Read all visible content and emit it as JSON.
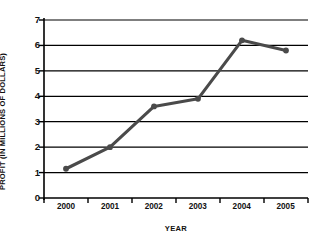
{
  "chart_data": {
    "type": "line",
    "title": "",
    "xlabel": "YEAR",
    "ylabel": "PROFIT (IN MILLIONS OF DOLLARS)",
    "categories": [
      "2000",
      "2001",
      "2002",
      "2003",
      "2004",
      "2005"
    ],
    "x": [
      2000,
      2001,
      2002,
      2003,
      2004,
      2005
    ],
    "values": [
      1.15,
      2.0,
      3.6,
      3.9,
      6.2,
      5.8
    ],
    "series": [
      {
        "name": "Profit",
        "values": [
          1.15,
          2.0,
          3.6,
          3.9,
          6.2,
          5.8
        ]
      }
    ],
    "ylim": [
      0,
      7
    ],
    "yticks": [
      0,
      1,
      2,
      3,
      4,
      5,
      6,
      7
    ],
    "ytick_labels": [
      "0",
      "1",
      "2",
      "3",
      "4",
      "5",
      "6",
      "7"
    ],
    "xtick_labels": [
      "2000",
      "2001",
      "2002",
      "2003",
      "2004",
      "2005"
    ],
    "grid": true,
    "grid_axis": "y",
    "legend": false,
    "legend_position": "none",
    "line_color": "#4a4a4a",
    "marker_color": "#4a4a4a",
    "axis_color": "#000000",
    "grid_color": "#000000",
    "background_color": "#ffffff",
    "line_width": 3,
    "marker": "circle"
  },
  "axes": {
    "y_title": "PROFIT (IN MILLIONS OF DOLLARS)",
    "x_title": "YEAR",
    "y_labels": [
      "7",
      "6",
      "5",
      "4",
      "3",
      "2",
      "1",
      "0"
    ],
    "x_labels": [
      "2000",
      "2001",
      "2002",
      "2003",
      "2004",
      "2005"
    ]
  }
}
